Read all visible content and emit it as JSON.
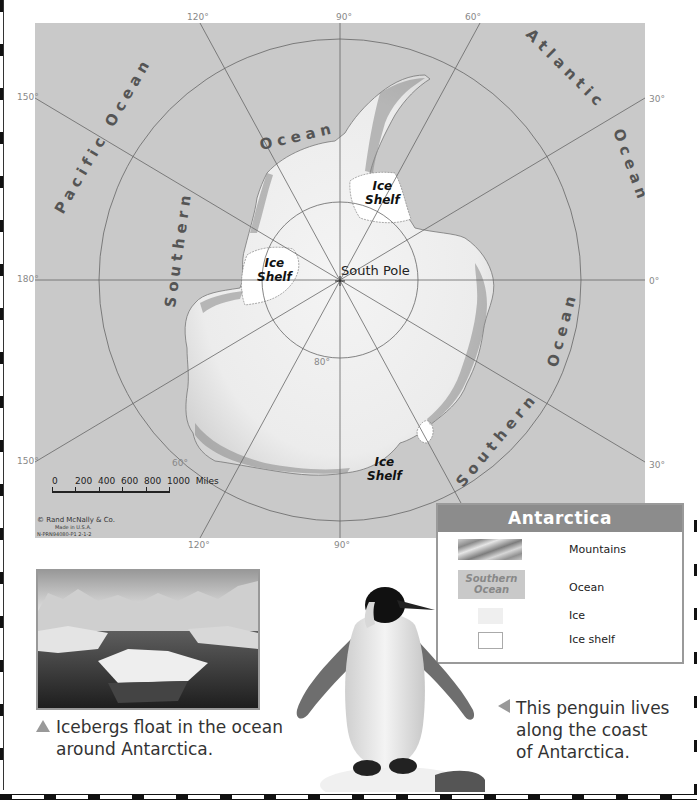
{
  "map": {
    "title": "Antarctica",
    "ocean_color": "#c9c9c9",
    "land_color": "#f2f2f2",
    "shelf_color": "#ffffff",
    "longitude_labels": {
      "top": [
        "120°",
        "90°",
        "60°"
      ],
      "left": [
        "150°",
        "180°",
        "150°"
      ],
      "right": [
        "30°",
        "0°",
        "30°"
      ],
      "bottom": [
        "120°",
        "90°"
      ]
    },
    "latitude_labels": [
      "80°",
      "60°"
    ],
    "pole_label": "South Pole",
    "ocean_labels": {
      "pacific": "Pacific Ocean",
      "southern_top_left": "Southern",
      "ocean_top": "Ocean",
      "atlantic": "Atlantic",
      "atlantic_ocean": "Ocean",
      "southern_bottom_right": "Southern",
      "ocean_right": "Ocean"
    },
    "ice_shelves": [
      {
        "line1": "Ice",
        "line2": "Shelf"
      },
      {
        "line1": "Ice",
        "line2": "Shelf"
      },
      {
        "line1": "Ice",
        "line2": "Shelf"
      }
    ],
    "scale": {
      "ticks": [
        "0",
        "200",
        "400",
        "600",
        "800",
        "1000"
      ],
      "unit": "Miles"
    },
    "credit": {
      "line1": "© Rand McNally & Co.",
      "line2": "Made in U.S.A.",
      "line3": "N-PRN94080-P1  2-1-2"
    }
  },
  "legend": {
    "title": "Antarctica",
    "items": [
      {
        "label": "Mountains",
        "swatch": "mountains"
      },
      {
        "label": "Ocean",
        "swatch": "ocean",
        "swatch_text_1": "Southern",
        "swatch_text_2": "Ocean"
      },
      {
        "label": "Ice",
        "swatch": "ice"
      },
      {
        "label": "Ice shelf",
        "swatch": "ice-shelf"
      }
    ]
  },
  "photos": {
    "icebergs": {
      "caption_line1": "Icebergs float in the ocean",
      "caption_line2": "around Antarctica."
    },
    "penguin": {
      "caption_line1": "This penguin lives",
      "caption_line2": "along the coast",
      "caption_line3": "of Antarctica."
    }
  }
}
